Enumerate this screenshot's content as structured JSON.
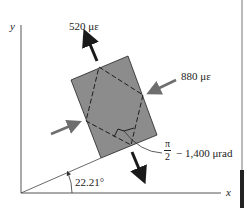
{
  "diagram": {
    "axes": {
      "x_label": "x",
      "y_label": "y"
    },
    "strains": {
      "tensile_label": "520 με",
      "compressive_label": "880 με",
      "shear_fraction_numerator": "π",
      "shear_fraction_denominator": "2",
      "shear_suffix": "− 1,400 μrad"
    },
    "angle_label": "22.21°",
    "colors": {
      "element_fill": "#8c8c8c",
      "arrow_dark": "#1a1a1a",
      "arrow_gray": "#6e6e6e",
      "line": "#333333"
    }
  }
}
